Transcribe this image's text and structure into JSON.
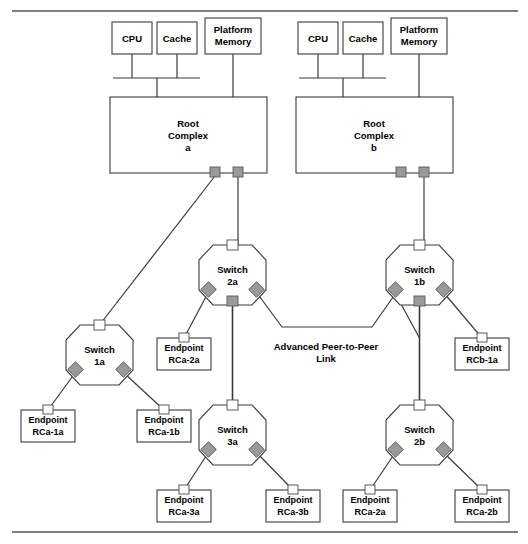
{
  "figure": {
    "title": "",
    "top_rule": true,
    "bottom_rule": true
  },
  "host_blocks": [
    {
      "id": "cpu-a",
      "label_line1": "CPU",
      "label_line2": "",
      "x": 112,
      "y": 22,
      "w": 40,
      "h": 32
    },
    {
      "id": "cache-a",
      "label_line1": "Cache",
      "label_line2": "",
      "x": 157,
      "y": 22,
      "w": 40,
      "h": 32
    },
    {
      "id": "platmem-a",
      "label_line1": "Platform",
      "label_line2": "Memory",
      "x": 205,
      "y": 18,
      "w": 56,
      "h": 36
    },
    {
      "id": "cpu-b",
      "label_line1": "CPU",
      "label_line2": "",
      "x": 298,
      "y": 22,
      "w": 40,
      "h": 32
    },
    {
      "id": "cache-b",
      "label_line1": "Cache",
      "label_line2": "",
      "x": 343,
      "y": 22,
      "w": 40,
      "h": 32
    },
    {
      "id": "platmem-b",
      "label_line1": "Platform",
      "label_line2": "Memory",
      "x": 391,
      "y": 18,
      "w": 56,
      "h": 36
    }
  ],
  "root_complexes": [
    {
      "id": "root-complex-a",
      "label_line1": "Root",
      "label_line2": "Complex",
      "label_line3": "a",
      "x": 110,
      "y": 97,
      "w": 157,
      "h": 76
    },
    {
      "id": "root-complex-b",
      "label_line1": "Root",
      "label_line2": "Complex",
      "label_line3": "b",
      "x": 296,
      "y": 97,
      "w": 157,
      "h": 76
    }
  ],
  "switches": [
    {
      "id": "switch-1a",
      "label_line1": "Switch",
      "label_line2": "1a",
      "cx": 99.5,
      "cy": 355,
      "rw": 33.5,
      "rh": 30
    },
    {
      "id": "switch-2a",
      "label_line1": "Switch",
      "label_line2": "2a",
      "cx": 232.5,
      "cy": 275,
      "rw": 33.5,
      "rh": 30
    },
    {
      "id": "switch-3a",
      "label_line1": "Switch",
      "label_line2": "3a",
      "cx": 232.5,
      "cy": 435,
      "rw": 33.5,
      "rh": 30
    },
    {
      "id": "switch-1b",
      "label_line1": "Switch",
      "label_line2": "1b",
      "cx": 419.5,
      "cy": 275,
      "rw": 33.5,
      "rh": 30
    },
    {
      "id": "switch-2b",
      "label_line1": "Switch",
      "label_line2": "2b",
      "cx": 419.5,
      "cy": 435,
      "rw": 33.5,
      "rh": 30
    }
  ],
  "endpoints": [
    {
      "id": "endpoint-rca-2a-top",
      "label_line1": "Endpoint",
      "label_line2": "RCa-2a",
      "x": 157,
      "y": 338,
      "w": 54,
      "h": 32
    },
    {
      "id": "endpoint-rcb-1a",
      "label_line1": "Endpoint",
      "label_line2": "RCb-1a",
      "x": 455,
      "y": 338,
      "w": 54,
      "h": 32
    },
    {
      "id": "endpoint-rca-1a",
      "label_line1": "Endpoint",
      "label_line2": "RCa-1a",
      "x": 21,
      "y": 410,
      "w": 54,
      "h": 32
    },
    {
      "id": "endpoint-rca-1b",
      "label_line1": "Endpoint",
      "label_line2": "RCa-1b",
      "x": 137,
      "y": 410,
      "w": 54,
      "h": 32
    },
    {
      "id": "endpoint-rca-3a",
      "label_line1": "Endpoint",
      "label_line2": "RCa-3a",
      "x": 157,
      "y": 490,
      "w": 54,
      "h": 32
    },
    {
      "id": "endpoint-rca-3b",
      "label_line1": "Endpoint",
      "label_line2": "RCa-3b",
      "x": 266,
      "y": 490,
      "w": 54,
      "h": 32
    },
    {
      "id": "endpoint-rca-2a-bot",
      "label_line1": "Endpoint",
      "label_line2": "RCa-2a",
      "x": 343,
      "y": 490,
      "w": 54,
      "h": 32
    },
    {
      "id": "endpoint-rca-2b",
      "label_line1": "Endpoint",
      "label_line2": "RCa-2b",
      "x": 455,
      "y": 490,
      "w": 54,
      "h": 32
    }
  ],
  "annotations": [
    {
      "id": "p2p-link-label",
      "line1": "Advanced Peer-to-Peer",
      "line2": "Link",
      "x": 326,
      "y": 350
    }
  ],
  "colors": {
    "stroke": "#3b3b3b",
    "port_fill": "#9a9a9a",
    "port_stroke": "#5a5a5a",
    "background": "#ffffff",
    "rule": "#555555"
  }
}
